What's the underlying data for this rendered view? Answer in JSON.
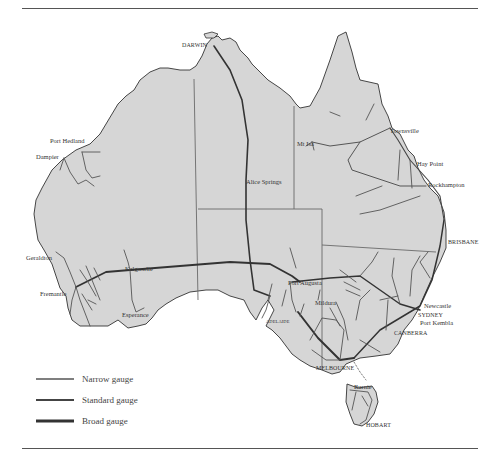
{
  "map": {
    "subject": "Australian railway network by gauge",
    "colors": {
      "land": "#d6d6d6",
      "coast": "#333333",
      "state_border": "#6a6a6a",
      "narrow_gauge": "#555555",
      "standard_gauge": "#3a3a3a",
      "broad_gauge": "#2a2a2a"
    },
    "labels": {
      "darwin": "DARWIN",
      "port_hedland": "Port Hedland",
      "dampier": "Dampier",
      "mt_isa": "Mt Isa",
      "townsville": "Townsville",
      "hay_point": "Hay Point",
      "rockhampton": "Rockhampton",
      "alice_springs": "Alice Springs",
      "brisbane": "BRISBANE",
      "geraldton": "Geraldton",
      "kalgoorlie": "Kalgoorlie",
      "fremantle": "Fremantle",
      "esperance": "Esperance",
      "port_augusta": "Port Augusta",
      "mildura": "Mildura",
      "adelaide": "ADELAIDE",
      "newcastle": "Newcastle",
      "sydney": "SYDNEY",
      "port_kembla": "Port Kembla",
      "canberra": "CANBERRA",
      "melbourne": "MELBOURNE",
      "burnie": "Burnie",
      "hobart": "HOBART"
    }
  },
  "legend": {
    "items": [
      {
        "label": "Narrow gauge",
        "color": "#555555",
        "width": 1.5
      },
      {
        "label": "Standard gauge",
        "color": "#444444",
        "width": 2
      },
      {
        "label": "Broad gauge",
        "color": "#333333",
        "width": 3
      }
    ]
  }
}
